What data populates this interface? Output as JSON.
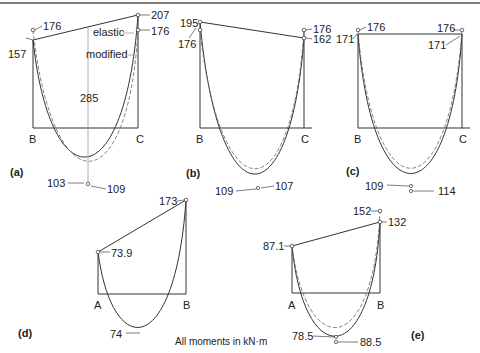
{
  "figure": {
    "note": "All moments in kN·m",
    "panels": [
      {
        "id": "a",
        "label": "(a)",
        "supports": [
          "B",
          "C"
        ],
        "values": {
          "left_top": "176",
          "left": "157",
          "right_top": "207",
          "right": "176",
          "span": "285",
          "mid_left": "103",
          "mid_right": "109"
        },
        "annotations": {
          "elastic": "elastic",
          "modified": "modified"
        }
      },
      {
        "id": "b",
        "label": "(b)",
        "supports": [
          "B",
          "C"
        ],
        "values": {
          "left_top": "195",
          "left": "176",
          "right_top": "176",
          "right": "162",
          "mid_left": "109",
          "mid_right": "107"
        }
      },
      {
        "id": "c",
        "label": "(c)",
        "supports": [
          "B",
          "C"
        ],
        "values": {
          "left_top": "176",
          "left": "171",
          "right_top": "176",
          "right": "171",
          "mid_left": "109",
          "mid_right": "114"
        }
      },
      {
        "id": "d",
        "label": "(d)",
        "supports": [
          "A",
          "B"
        ],
        "values": {
          "left": "73.9",
          "right": "173",
          "mid": "74"
        }
      },
      {
        "id": "e",
        "label": "(e)",
        "supports": [
          "A",
          "B"
        ],
        "values": {
          "left": "87.1",
          "right_top": "152",
          "right": "132",
          "mid_left": "78.5",
          "mid_right": "88.5"
        }
      }
    ]
  }
}
